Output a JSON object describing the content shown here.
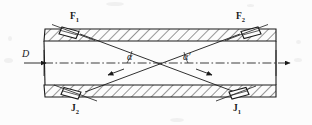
{
  "figure": {
    "type": "ultrasonic-flowmeter-pipe-cross-section",
    "background_color": "#fcfcfc",
    "ink_color": "#1a1a1a"
  },
  "labels": {
    "transducer_top_left": "F",
    "transducer_top_left_sub": "1",
    "transducer_top_right": "F",
    "transducer_top_right_sub": "2",
    "transducer_bottom_left": "J",
    "transducer_bottom_left_sub": "2",
    "transducer_bottom_right": "J",
    "transducer_bottom_right_sub": "1",
    "angle_left": "α",
    "angle_right": "α",
    "angle_right_prime": "′",
    "diameter": "D"
  }
}
